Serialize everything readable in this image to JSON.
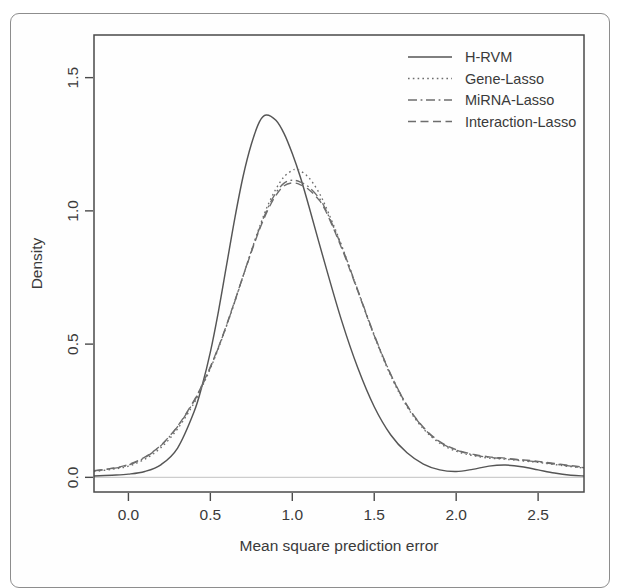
{
  "figure": {
    "kind": "density-plot",
    "background_color": "#ffffff",
    "frame_color": "#4a4a4a",
    "page_border_color": "#8d8d8d"
  },
  "chart_data": {
    "type": "line",
    "title": "",
    "xlabel": "Mean square prediction error",
    "ylabel": "Density",
    "xlim": [
      -0.21,
      2.78
    ],
    "ylim": [
      -0.055,
      1.66
    ],
    "xticks": [
      0.0,
      0.5,
      1.0,
      1.5,
      2.0,
      2.5
    ],
    "xtick_labels": [
      "0.0",
      "0.5",
      "1.0",
      "1.5",
      "2.0",
      "2.5"
    ],
    "yticks": [
      0.0,
      0.5,
      1.0,
      1.5
    ],
    "ytick_labels": [
      "0.0",
      "0.5",
      "1.0",
      "1.5"
    ],
    "grid": false,
    "legend_position": "top-right",
    "series": [
      {
        "name": "H-RVM",
        "linestyle": "solid",
        "color": "#555555",
        "peak_x": 0.84,
        "peak_y": 1.36,
        "x": [
          -0.21,
          -0.1,
          0.0,
          0.1,
          0.2,
          0.3,
          0.4,
          0.45,
          0.5,
          0.55,
          0.6,
          0.65,
          0.7,
          0.75,
          0.8,
          0.84,
          0.9,
          0.95,
          1.0,
          1.05,
          1.1,
          1.2,
          1.3,
          1.4,
          1.5,
          1.6,
          1.7,
          1.8,
          1.9,
          2.0,
          2.1,
          2.2,
          2.3,
          2.4,
          2.5,
          2.6,
          2.7,
          2.78
        ],
        "y": [
          0.005,
          0.008,
          0.012,
          0.022,
          0.048,
          0.11,
          0.245,
          0.345,
          0.47,
          0.625,
          0.8,
          0.975,
          1.13,
          1.25,
          1.335,
          1.36,
          1.34,
          1.29,
          1.215,
          1.125,
          1.02,
          0.8,
          0.59,
          0.41,
          0.265,
          0.16,
          0.092,
          0.05,
          0.028,
          0.022,
          0.03,
          0.042,
          0.046,
          0.04,
          0.028,
          0.016,
          0.008,
          0.005
        ]
      },
      {
        "name": "Gene-Lasso",
        "linestyle": "dotted",
        "color": "#6d6d6d",
        "peak_x": 1.02,
        "peak_y": 1.155,
        "x": [
          -0.21,
          -0.1,
          0.0,
          0.1,
          0.2,
          0.3,
          0.4,
          0.45,
          0.5,
          0.55,
          0.6,
          0.65,
          0.7,
          0.75,
          0.8,
          0.85,
          0.9,
          0.95,
          1.0,
          1.02,
          1.05,
          1.1,
          1.15,
          1.2,
          1.3,
          1.4,
          1.5,
          1.6,
          1.7,
          1.8,
          1.9,
          2.0,
          2.1,
          2.2,
          2.3,
          2.4,
          2.5,
          2.6,
          2.7,
          2.78
        ],
        "y": [
          0.022,
          0.03,
          0.042,
          0.068,
          0.112,
          0.182,
          0.278,
          0.34,
          0.408,
          0.485,
          0.57,
          0.66,
          0.755,
          0.85,
          0.94,
          1.02,
          1.082,
          1.128,
          1.152,
          1.155,
          1.15,
          1.125,
          1.082,
          1.022,
          0.872,
          0.7,
          0.53,
          0.382,
          0.265,
          0.182,
          0.128,
          0.098,
          0.082,
          0.072,
          0.068,
          0.062,
          0.056,
          0.048,
          0.04,
          0.035
        ]
      },
      {
        "name": "MiRNA-Lasso",
        "linestyle": "dashdot",
        "color": "#6d6d6d",
        "peak_x": 1.0,
        "peak_y": 1.115,
        "x": [
          -0.21,
          -0.1,
          0.0,
          0.1,
          0.2,
          0.3,
          0.4,
          0.45,
          0.5,
          0.55,
          0.6,
          0.65,
          0.7,
          0.75,
          0.8,
          0.85,
          0.9,
          0.95,
          1.0,
          1.05,
          1.1,
          1.15,
          1.2,
          1.3,
          1.4,
          1.5,
          1.6,
          1.7,
          1.8,
          1.9,
          2.0,
          2.1,
          2.2,
          2.3,
          2.4,
          2.5,
          2.6,
          2.7,
          2.78
        ],
        "y": [
          0.024,
          0.033,
          0.046,
          0.074,
          0.12,
          0.19,
          0.285,
          0.345,
          0.412,
          0.488,
          0.572,
          0.662,
          0.756,
          0.848,
          0.935,
          1.01,
          1.068,
          1.104,
          1.115,
          1.108,
          1.09,
          1.058,
          1.01,
          0.868,
          0.702,
          0.535,
          0.388,
          0.27,
          0.186,
          0.132,
          0.102,
          0.085,
          0.075,
          0.07,
          0.064,
          0.058,
          0.05,
          0.042,
          0.036
        ]
      },
      {
        "name": "Interaction-Lasso",
        "linestyle": "dashed",
        "color": "#6d6d6d",
        "peak_x": 1.0,
        "peak_y": 1.105,
        "x": [
          -0.21,
          -0.1,
          0.0,
          0.1,
          0.2,
          0.3,
          0.4,
          0.45,
          0.5,
          0.55,
          0.6,
          0.65,
          0.7,
          0.75,
          0.8,
          0.85,
          0.9,
          0.95,
          1.0,
          1.05,
          1.1,
          1.15,
          1.2,
          1.3,
          1.4,
          1.5,
          1.6,
          1.7,
          1.8,
          1.9,
          2.0,
          2.1,
          2.2,
          2.3,
          2.4,
          2.5,
          2.6,
          2.7,
          2.78
        ],
        "y": [
          0.025,
          0.034,
          0.048,
          0.076,
          0.122,
          0.192,
          0.288,
          0.348,
          0.415,
          0.49,
          0.574,
          0.664,
          0.756,
          0.845,
          0.93,
          1.002,
          1.058,
          1.094,
          1.105,
          1.098,
          1.08,
          1.05,
          1.004,
          0.862,
          0.698,
          0.532,
          0.386,
          0.27,
          0.188,
          0.134,
          0.104,
          0.087,
          0.077,
          0.072,
          0.066,
          0.06,
          0.052,
          0.044,
          0.038
        ]
      }
    ],
    "baseline": {
      "y": 0.0,
      "color": "#cdcdcd"
    }
  },
  "legend": {
    "entries": [
      {
        "label": "H-RVM",
        "linestyle": "solid"
      },
      {
        "label": "Gene-Lasso",
        "linestyle": "dotted"
      },
      {
        "label": "MiRNA-Lasso",
        "linestyle": "dashdot"
      },
      {
        "label": "Interaction-Lasso",
        "linestyle": "dashed"
      }
    ]
  }
}
